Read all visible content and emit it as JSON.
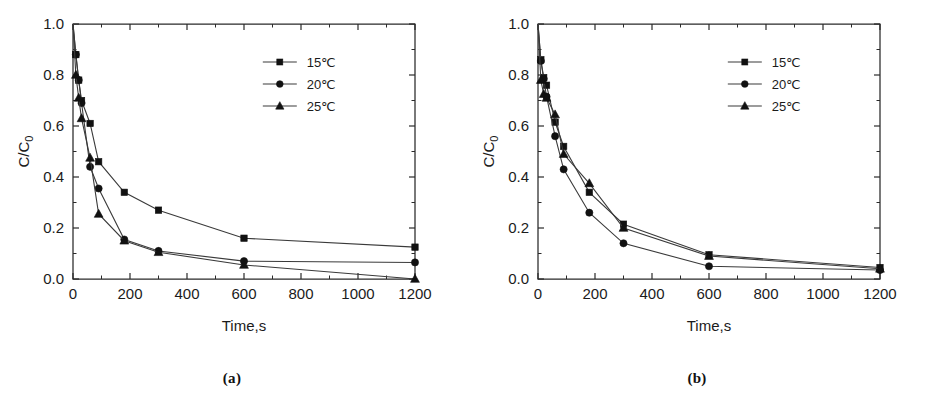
{
  "figure": {
    "panels": [
      {
        "id": "a",
        "caption": "(a)",
        "chart_data": {
          "type": "line",
          "title": "",
          "subtitle": "",
          "xlabel": "Time,s",
          "ylabel": "C/C₀",
          "xlim": [
            0,
            1200
          ],
          "ylim": [
            0.0,
            1.0
          ],
          "xticks": [
            0,
            200,
            400,
            600,
            800,
            1000,
            1200
          ],
          "xticklabels": [
            "0",
            "200",
            "400",
            "600",
            "800",
            "1000",
            "1200"
          ],
          "yticks": [
            0.0,
            0.2,
            0.4,
            0.6,
            0.8,
            1.0
          ],
          "yticklabels": [
            "0.0",
            "0.2",
            "0.4",
            "0.6",
            "0.8",
            "1.0"
          ],
          "x_minor_step": 100,
          "y_minor_step": 0.1,
          "grid": false,
          "legend_position": "top-right",
          "series": [
            {
              "name": "15℃",
              "marker": "square",
              "x": [
                0,
                10,
                20,
                30,
                60,
                90,
                180,
                300,
                600,
                1200
              ],
              "values": [
                1.0,
                0.88,
                0.78,
                0.7,
                0.61,
                0.46,
                0.34,
                0.27,
                0.16,
                0.125
              ]
            },
            {
              "name": "20℃",
              "marker": "circle",
              "x": [
                0,
                10,
                20,
                30,
                60,
                90,
                180,
                300,
                600,
                1200
              ],
              "values": [
                1.0,
                0.88,
                0.78,
                0.69,
                0.44,
                0.355,
                0.155,
                0.11,
                0.07,
                0.065
              ]
            },
            {
              "name": "25℃",
              "marker": "triangle",
              "x": [
                0,
                10,
                20,
                30,
                60,
                90,
                180,
                300,
                600,
                1200
              ],
              "values": [
                1.0,
                0.8,
                0.71,
                0.63,
                0.475,
                0.255,
                0.15,
                0.105,
                0.055,
                0.0
              ]
            }
          ]
        }
      },
      {
        "id": "b",
        "caption": "(b)",
        "chart_data": {
          "type": "line",
          "title": "",
          "subtitle": "",
          "xlabel": "Time,s",
          "ylabel": "C/C₀",
          "xlim": [
            0,
            1200
          ],
          "ylim": [
            0.0,
            1.0
          ],
          "xticks": [
            0,
            200,
            400,
            600,
            800,
            1000,
            1200
          ],
          "xticklabels": [
            "0",
            "200",
            "400",
            "600",
            "800",
            "1000",
            "1200"
          ],
          "yticks": [
            0.0,
            0.2,
            0.4,
            0.6,
            0.8,
            1.0
          ],
          "yticklabels": [
            "0.0",
            "0.2",
            "0.4",
            "0.6",
            "0.8",
            "1.0"
          ],
          "x_minor_step": 100,
          "y_minor_step": 0.1,
          "grid": false,
          "legend_position": "top-right",
          "series": [
            {
              "name": "15℃",
              "marker": "square",
              "x": [
                0,
                10,
                20,
                30,
                60,
                90,
                180,
                300,
                600,
                1200
              ],
              "values": [
                1.0,
                0.86,
                0.79,
                0.76,
                0.615,
                0.52,
                0.34,
                0.215,
                0.095,
                0.045
              ]
            },
            {
              "name": "20℃",
              "marker": "circle",
              "x": [
                0,
                10,
                20,
                30,
                60,
                90,
                180,
                300,
                600,
                1200
              ],
              "values": [
                1.0,
                0.855,
                0.785,
                0.715,
                0.56,
                0.43,
                0.26,
                0.14,
                0.05,
                0.035
              ]
            },
            {
              "name": "25℃",
              "marker": "triangle",
              "x": [
                0,
                10,
                20,
                30,
                60,
                90,
                180,
                300,
                600,
                1200
              ],
              "values": [
                1.0,
                0.78,
                0.725,
                0.71,
                0.645,
                0.49,
                0.375,
                0.2,
                0.09,
                0.04,
                0.03
              ]
            }
          ]
        }
      }
    ]
  }
}
